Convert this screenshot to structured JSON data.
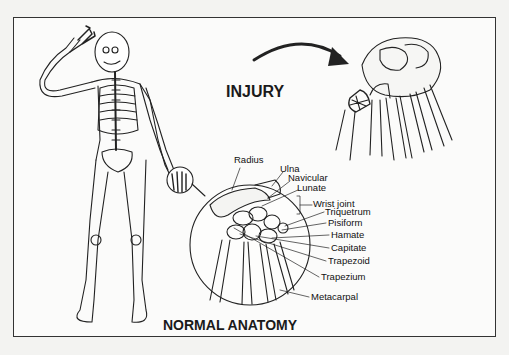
{
  "diagram": {
    "injury_title": "INJURY",
    "normal_title": "NORMAL ANATOMY",
    "labels": [
      {
        "text": "Radius",
        "x": 234,
        "y": 160
      },
      {
        "text": "Ulna",
        "x": 280,
        "y": 169
      },
      {
        "text": "Navicular",
        "x": 288,
        "y": 178
      },
      {
        "text": "Lunate",
        "x": 297,
        "y": 188
      },
      {
        "text": "Wrist joint",
        "x": 313,
        "y": 200
      },
      {
        "text": "Triquetrum",
        "x": 325,
        "y": 207
      },
      {
        "text": "Pisiform",
        "x": 328,
        "y": 218
      },
      {
        "text": "Hamate",
        "x": 331,
        "y": 230
      },
      {
        "text": "Capitate",
        "x": 331,
        "y": 243
      },
      {
        "text": "Trapezoid",
        "x": 328,
        "y": 256
      },
      {
        "text": "Trapezium",
        "x": 321,
        "y": 272
      },
      {
        "text": "Metacarpal",
        "x": 311,
        "y": 292
      }
    ],
    "colors": {
      "line": "#222222",
      "background": "#fbfbfa",
      "page": "#f3f3f1"
    }
  }
}
